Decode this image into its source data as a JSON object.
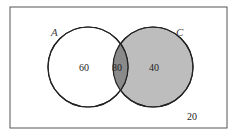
{
  "diagram": {
    "type": "venn",
    "sets": [
      {
        "name": "A",
        "only_value": "60"
      },
      {
        "name": "C",
        "only_value": "40"
      }
    ],
    "intersection_value": "80",
    "outside_value": "20",
    "colors": {
      "background": "#ffffff",
      "border": "#444444",
      "circle_a_fill": "#ffffff",
      "circle_c_fill": "#bdbdbd",
      "intersection_fill": "#8a8a8a",
      "text": "#222222"
    }
  }
}
